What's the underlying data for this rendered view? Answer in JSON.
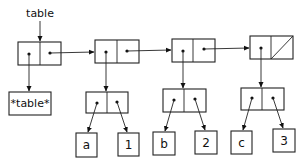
{
  "diagram": {
    "type": "box-and-pointer",
    "variable_label": "table",
    "header_atom": "*table*",
    "spine_cells": [
      {
        "id": "c0",
        "x": 18,
        "y": 42,
        "w": 43,
        "h": 23,
        "split": 40,
        "cdr": "pointer"
      },
      {
        "id": "c1",
        "x": 95,
        "y": 40,
        "w": 44,
        "h": 23,
        "split": 117,
        "cdr": "pointer"
      },
      {
        "id": "c2",
        "x": 172,
        "y": 39,
        "w": 43,
        "h": 23,
        "split": 193,
        "cdr": "pointer"
      },
      {
        "id": "c3",
        "x": 250,
        "y": 36,
        "w": 43,
        "h": 23,
        "split": 271,
        "cdr": "nil"
      }
    ],
    "record_cells": [
      {
        "id": "r1",
        "x": 86,
        "y": 92,
        "w": 42,
        "h": 21,
        "split": 107
      },
      {
        "id": "r2",
        "x": 163,
        "y": 89,
        "w": 43,
        "h": 23,
        "split": 184
      },
      {
        "id": "r3",
        "x": 241,
        "y": 88,
        "w": 43,
        "h": 22,
        "split": 262
      }
    ],
    "records": [
      {
        "key": "a",
        "value": "1"
      },
      {
        "key": "b",
        "value": "2"
      },
      {
        "key": "c",
        "value": "3"
      }
    ]
  }
}
